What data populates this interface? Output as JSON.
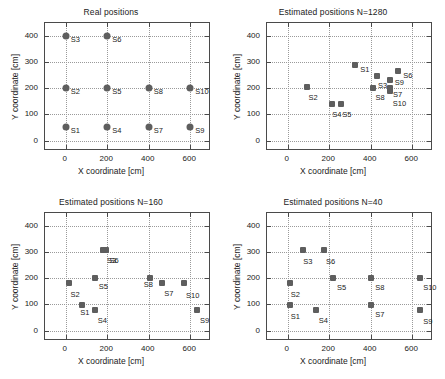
{
  "figure": {
    "width": 445,
    "height": 379,
    "background": "#ffffff",
    "marker_color": "#5e5e5e",
    "axis_color": "#4a4a4a",
    "grid_color": "#9a9a9a"
  },
  "chart_data": [
    {
      "type": "scatter",
      "title": "Real positions",
      "xlabel": "X coordinate [cm]",
      "ylabel": "Y coordinate [cm]",
      "xlim": [
        -100,
        700
      ],
      "ylim": [
        -40,
        450
      ],
      "xticks": [
        0,
        200,
        400,
        600
      ],
      "yticks": [
        0,
        100,
        200,
        300,
        400
      ],
      "grid": true,
      "marker": "circle",
      "points": [
        {
          "label": "S1",
          "x": 0,
          "y": 50
        },
        {
          "label": "S2",
          "x": 0,
          "y": 200
        },
        {
          "label": "S3",
          "x": 0,
          "y": 400
        },
        {
          "label": "S4",
          "x": 200,
          "y": 50
        },
        {
          "label": "S5",
          "x": 200,
          "y": 200
        },
        {
          "label": "S6",
          "x": 200,
          "y": 400
        },
        {
          "label": "S7",
          "x": 400,
          "y": 50
        },
        {
          "label": "S8",
          "x": 400,
          "y": 200
        },
        {
          "label": "S9",
          "x": 600,
          "y": 50
        },
        {
          "label": "S10",
          "x": 600,
          "y": 200
        }
      ]
    },
    {
      "type": "scatter",
      "title": "Estimated positions N=1280",
      "xlabel": "X coordinate [cm]",
      "ylabel": "Y coordinate [cm]",
      "xlim": [
        -100,
        700
      ],
      "ylim": [
        -40,
        450
      ],
      "xticks": [
        0,
        200,
        400,
        600
      ],
      "yticks": [
        0,
        100,
        200,
        300,
        400
      ],
      "grid": true,
      "marker": "square",
      "points": [
        {
          "label": "S1",
          "x": 325,
          "y": 290
        },
        {
          "label": "S2",
          "x": 95,
          "y": 205
        },
        {
          "label": "S3",
          "x": 430,
          "y": 248
        },
        {
          "label": "S4",
          "x": 215,
          "y": 140
        },
        {
          "label": "S5",
          "x": 258,
          "y": 140
        },
        {
          "label": "S6",
          "x": 533,
          "y": 268
        },
        {
          "label": "S7",
          "x": 493,
          "y": 200
        },
        {
          "label": "S8",
          "x": 413,
          "y": 203
        },
        {
          "label": "S9",
          "x": 492,
          "y": 233
        },
        {
          "label": "S10",
          "x": 492,
          "y": 188
        }
      ]
    },
    {
      "type": "scatter",
      "title": "Estimated positions N=160",
      "xlabel": "X coordinate [cm]",
      "ylabel": "Y coordinate [cm]",
      "xlim": [
        -100,
        700
      ],
      "ylim": [
        -40,
        450
      ],
      "xticks": [
        0,
        200,
        400,
        600
      ],
      "yticks": [
        0,
        100,
        200,
        300,
        400
      ],
      "grid": true,
      "marker": "square",
      "points": [
        {
          "label": "S1",
          "x": 80,
          "y": 97
        },
        {
          "label": "S2",
          "x": 18,
          "y": 182
        },
        {
          "label": "S3",
          "x": 180,
          "y": 310
        },
        {
          "label": "S4",
          "x": 140,
          "y": 77
        },
        {
          "label": "S5",
          "x": 140,
          "y": 203
        },
        {
          "label": "S6",
          "x": 192,
          "y": 310
        },
        {
          "label": "S7",
          "x": 465,
          "y": 182
        },
        {
          "label": "S8",
          "x": 405,
          "y": 203
        },
        {
          "label": "S9",
          "x": 633,
          "y": 77
        },
        {
          "label": "S10",
          "x": 570,
          "y": 182
        }
      ]
    },
    {
      "type": "scatter",
      "title": "Estimated positions N=40",
      "xlabel": "X coordinate [cm]",
      "ylabel": "Y coordinate [cm]",
      "xlim": [
        -100,
        700
      ],
      "ylim": [
        -40,
        450
      ],
      "xticks": [
        0,
        200,
        400,
        600
      ],
      "yticks": [
        0,
        100,
        200,
        300,
        400
      ],
      "grid": true,
      "marker": "square",
      "points": [
        {
          "label": "S1",
          "x": 10,
          "y": 97
        },
        {
          "label": "S2",
          "x": 10,
          "y": 182
        },
        {
          "label": "S3",
          "x": 75,
          "y": 310
        },
        {
          "label": "S4",
          "x": 135,
          "y": 77
        },
        {
          "label": "S5",
          "x": 218,
          "y": 203
        },
        {
          "label": "S6",
          "x": 175,
          "y": 310
        },
        {
          "label": "S7",
          "x": 403,
          "y": 97
        },
        {
          "label": "S8",
          "x": 403,
          "y": 203
        },
        {
          "label": "S9",
          "x": 638,
          "y": 77
        },
        {
          "label": "S10",
          "x": 638,
          "y": 203
        }
      ]
    }
  ]
}
